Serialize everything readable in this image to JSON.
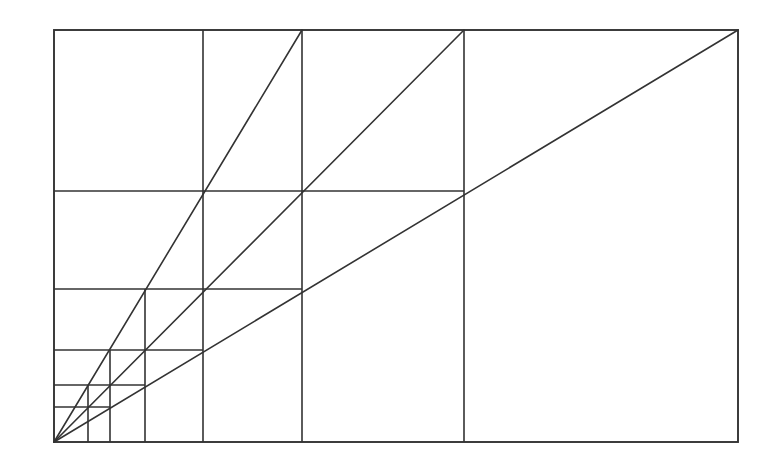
{
  "diagram": {
    "title": "",
    "colors": {
      "background": "#ffffff",
      "stroke": "#333333"
    },
    "stroke_width": 1.6,
    "frame": {
      "x1": 54,
      "y1": 30,
      "x2": 738,
      "y2": 442
    },
    "vertical_lines": [
      {
        "x": 88,
        "y1": 385,
        "y2": 442
      },
      {
        "x": 110,
        "y1": 350,
        "y2": 442
      },
      {
        "x": 145,
        "y1": 289,
        "y2": 442
      },
      {
        "x": 203,
        "y1": 30,
        "y2": 442
      },
      {
        "x": 302,
        "y1": 30,
        "y2": 442
      },
      {
        "x": 464,
        "y1": 30,
        "y2": 442
      }
    ],
    "horizontal_lines": [
      {
        "y": 191,
        "x1": 54,
        "x2": 464
      },
      {
        "y": 289,
        "x1": 54,
        "x2": 302
      },
      {
        "y": 350,
        "x1": 54,
        "x2": 203
      },
      {
        "y": 385,
        "x1": 54,
        "x2": 145
      },
      {
        "y": 407,
        "x1": 54,
        "x2": 110
      }
    ],
    "diagonals": [
      {
        "name": "steep",
        "x1": 54,
        "y1": 442,
        "x2": 302,
        "y2": 30
      },
      {
        "name": "middle",
        "x1": 54,
        "y1": 442,
        "x2": 464,
        "y2": 30
      },
      {
        "name": "low",
        "x1": 54,
        "y1": 442,
        "x2": 738,
        "y2": 30
      }
    ]
  }
}
